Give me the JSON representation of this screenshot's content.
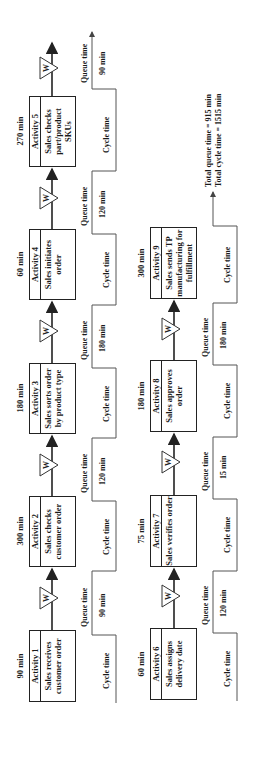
{
  "diagram": {
    "rows": [
      {
        "activities": [
          {
            "name": "Activity 1",
            "description": "Sales receives customer order",
            "duration": "90 min"
          },
          {
            "name": "Activity 2",
            "description": "Sales checks customer order",
            "duration": "300 min"
          },
          {
            "name": "Activity 3",
            "description": "Sales sorts order by product type",
            "duration": "180 min"
          },
          {
            "name": "Activity 4",
            "description": "Sales initiates order",
            "duration": "60 min"
          },
          {
            "name": "Activity 5",
            "description": "Sales checks part/product SKUs",
            "duration": "270 min"
          }
        ],
        "queue_times": [
          "90 min",
          "120 min",
          "180 min",
          "120 min",
          "90 min"
        ]
      },
      {
        "activities": [
          {
            "name": "Activity 6",
            "description": "Sales assigns delivery date",
            "duration": "60 min"
          },
          {
            "name": "Activity 7",
            "description": "Sales verifies order",
            "duration": "75 min"
          },
          {
            "name": "Activity 8",
            "description": "Sales approves order",
            "duration": "180 min"
          },
          {
            "name": "Activity 9",
            "description": "Sales sends TP manufacturing for fulfillment",
            "duration": "300 min"
          }
        ],
        "queue_times": [
          "120 min",
          "15 min",
          "180 min"
        ]
      }
    ],
    "labels": {
      "queue_time": "Queue time",
      "cycle_time": "Cycle time",
      "wait_symbol": "W"
    },
    "totals": {
      "queue": "Total queue time = 915 min",
      "cycle": "Total cycle time = 1515 min"
    }
  }
}
